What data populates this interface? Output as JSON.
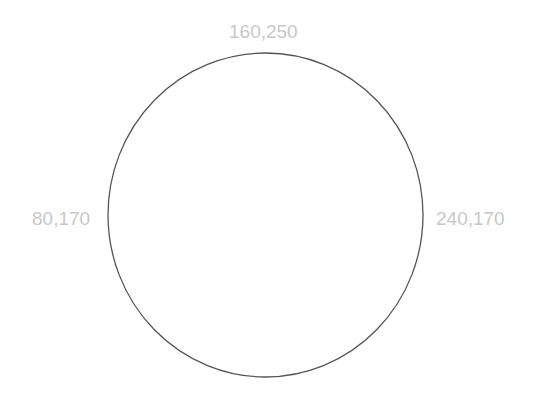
{
  "diagram": {
    "shape": "circle",
    "stroke_color": "#555555",
    "label_color": "#c8c8c8",
    "labels": {
      "top": "160,250",
      "left": "80,170",
      "right": "240,170"
    }
  }
}
